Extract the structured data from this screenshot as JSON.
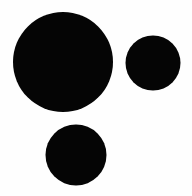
{
  "canvas": {
    "width": 192,
    "height": 196,
    "background_color": "#fefefe",
    "description": "Three solid black filled circles of differing sizes on a white background"
  },
  "palette": {
    "fill_color": "#050505",
    "background_color": "#fefefe"
  },
  "shapes": [
    {
      "name": "large-circle",
      "label": "Large circle",
      "cx": 63,
      "cy": 62,
      "r": 50,
      "diameter": 100,
      "fill": "#050505",
      "position": "upper-left"
    },
    {
      "name": "medium-circle",
      "label": "Medium circle",
      "cx": 153,
      "cy": 63,
      "r": 27.5,
      "diameter": 55,
      "fill": "#050505",
      "position": "upper-right"
    },
    {
      "name": "small-circle",
      "label": "Small circle",
      "cx": 76,
      "cy": 155,
      "r": 30.5,
      "diameter": 61,
      "fill": "#050505",
      "position": "lower-center"
    }
  ]
}
